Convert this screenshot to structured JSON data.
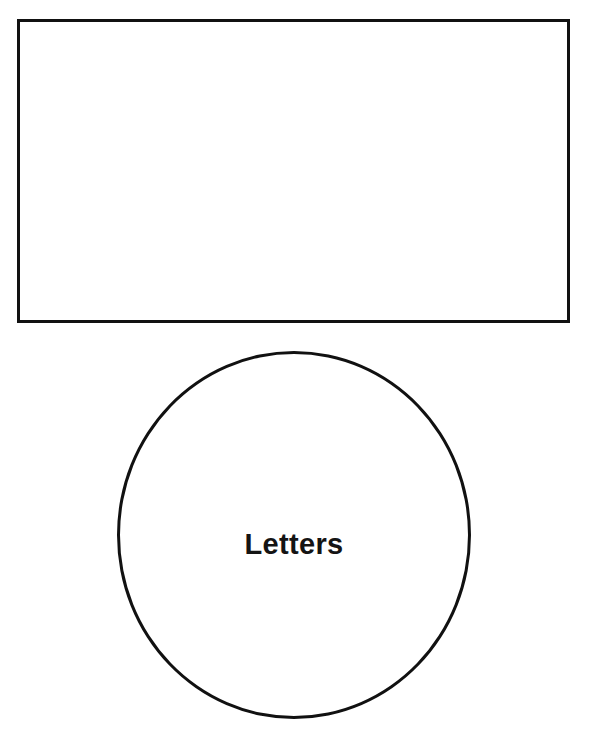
{
  "page": {
    "background_color": "#ffffff",
    "stroke_color": "#111111",
    "text_color": "#141414",
    "width": 590,
    "height": 745
  },
  "shapes": {
    "answer_box": {
      "shape": "rectangle",
      "label": "",
      "fill": "#ffffff",
      "stroke": "#111111",
      "stroke_width": 3
    },
    "category_circle": {
      "shape": "circle",
      "label": "Letters",
      "fill": "#ffffff",
      "stroke": "#111111",
      "stroke_width": 3
    }
  }
}
